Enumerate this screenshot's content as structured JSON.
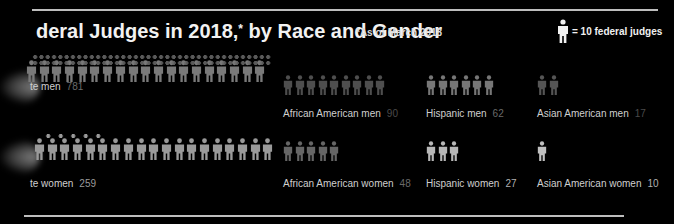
{
  "header": {
    "title": "deral Judges in 2018,",
    "title_asterisk": "*",
    "title_suffix": " by Race and Gender",
    "note": "*As of March 2018",
    "legend_label": "= 10 federal judges"
  },
  "colors": {
    "background": "#000000",
    "icon_white": "#8a8a8a",
    "icon_dim": "#5a5a5a",
    "icon_bright": "#bdbdbd",
    "text": "#cfcfcf",
    "number_dim": "#6a6a6a"
  },
  "groups": [
    {
      "label": "te men",
      "value": "781",
      "icons": 19,
      "row": "men"
    },
    {
      "label": "African American men",
      "value": "90",
      "icons": 9,
      "row": "men"
    },
    {
      "label": "Hispanic men",
      "value": "62",
      "icons": 6,
      "row": "men"
    },
    {
      "label": "Asian American men",
      "value": "17",
      "icons": 2,
      "row": "men"
    },
    {
      "label": "te women",
      "value": "259",
      "icons": 19,
      "row": "women"
    },
    {
      "label": "African American women",
      "value": "48",
      "icons": 5,
      "row": "women"
    },
    {
      "label": "Hispanic women",
      "value": "27",
      "icons": 3,
      "row": "women"
    },
    {
      "label": "Asian American women",
      "value": "10",
      "icons": 1,
      "row": "women"
    }
  ],
  "chart_data": {
    "type": "pictograph",
    "note": "*As of March 2018",
    "unit": "1 icon = 10 federal judges",
    "categories": [
      "White",
      "African American",
      "Hispanic",
      "Asian American"
    ],
    "series": [
      {
        "name": "men",
        "values": [
          781,
          90,
          62,
          17
        ]
      },
      {
        "name": "women",
        "values": [
          259,
          48,
          27,
          10
        ]
      }
    ]
  }
}
